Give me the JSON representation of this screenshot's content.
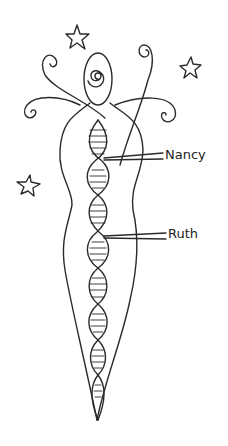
{
  "illustration": {
    "subject": "goddess figure with DNA double helix",
    "labels": [
      {
        "text": "Nancy",
        "x": 168,
        "y": 153
      },
      {
        "text": "Ruth",
        "x": 171,
        "y": 232
      }
    ],
    "stars": 3,
    "ink_color": "#2b2b2b",
    "background": "#ffffff"
  }
}
